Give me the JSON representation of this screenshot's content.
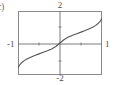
{
  "figure": {
    "item_label": "c)",
    "frame": {
      "x": 18,
      "y": 11,
      "width": 84,
      "height": 64
    }
  },
  "chart_data": {
    "type": "line",
    "title": "",
    "subtitle": "",
    "xlabel": "",
    "ylabel": "",
    "grid": false,
    "legend": null,
    "xlim": [
      -1,
      1
    ],
    "ylim": [
      -2,
      2
    ],
    "x_tick_labels": [
      "-1",
      "1"
    ],
    "y_tick_labels": [
      "-2",
      "2"
    ],
    "x_ticks": [
      -1,
      -0.5,
      0.5,
      1
    ],
    "y_ticks": [
      -2,
      -1,
      1,
      2
    ],
    "annotations": [
      {
        "text": "2",
        "position": "top",
        "value": 2
      },
      {
        "text": "-2",
        "position": "bottom",
        "value": -2
      },
      {
        "text": "-1",
        "position": "left",
        "value": -1
      },
      {
        "text": "1",
        "position": "right",
        "value": 1
      }
    ],
    "series": [
      {
        "name": "odd increasing curve",
        "color": "#555555",
        "x": [
          -1.0,
          -0.95,
          -0.9,
          -0.85,
          -0.8,
          -0.7,
          -0.6,
          -0.5,
          -0.4,
          -0.3,
          -0.2,
          -0.1,
          0.0,
          0.1,
          0.2,
          0.3,
          0.4,
          0.5,
          0.6,
          0.7,
          0.8,
          0.85,
          0.9,
          0.95,
          1.0
        ],
        "y": [
          -1.55,
          -1.33,
          -1.2,
          -1.1,
          -1.02,
          -0.89,
          -0.78,
          -0.68,
          -0.58,
          -0.48,
          -0.37,
          -0.22,
          0.0,
          0.22,
          0.37,
          0.48,
          0.58,
          0.68,
          0.78,
          0.89,
          1.02,
          1.1,
          1.2,
          1.33,
          1.55
        ]
      }
    ]
  }
}
